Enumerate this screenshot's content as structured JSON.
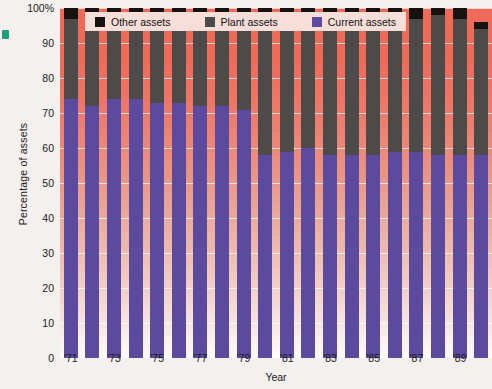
{
  "chart_data": {
    "type": "bar",
    "subtype": "100% stacked bar",
    "title": "",
    "xlabel": "Year",
    "ylabel": "Percentage of assets",
    "ylim": [
      0,
      100
    ],
    "yticks": [
      0,
      10,
      20,
      30,
      40,
      50,
      60,
      70,
      80,
      90,
      100
    ],
    "ytick_labels": [
      "0",
      "10",
      "20",
      "30",
      "40",
      "50",
      "60",
      "70",
      "80",
      "90",
      "100%"
    ],
    "grid": true,
    "legend_position": "top",
    "categories": [
      "'71",
      "'72",
      "'73",
      "'74",
      "'75",
      "'76",
      "'77",
      "'78",
      "'79",
      "'80",
      "'81",
      "'82",
      "'83",
      "'84",
      "'85",
      "'86",
      "'87",
      "'88",
      "'89",
      "'90"
    ],
    "xtick_labels": [
      "'71",
      "",
      "'73",
      "",
      "'75",
      "",
      "'77",
      "",
      "'79",
      "",
      "'81",
      "",
      "'83",
      "",
      "'85",
      "",
      "'87",
      "",
      "'89",
      ""
    ],
    "series": [
      {
        "name": "Current assets",
        "color": "#5b4a9e",
        "values": [
          74,
          72,
          74,
          74,
          73,
          73,
          72,
          72,
          71,
          58,
          59,
          60,
          58,
          58,
          58,
          59,
          59,
          58,
          58,
          58
        ]
      },
      {
        "name": "Plant assets",
        "color": "#4c4b49",
        "values": [
          23,
          25,
          23,
          23,
          24,
          24,
          26,
          25,
          26,
          40,
          39,
          38,
          40,
          40,
          40,
          38,
          38,
          40,
          39,
          36
        ]
      },
      {
        "name": "Other assets",
        "color": "#15120f",
        "values": [
          3,
          3,
          3,
          3,
          3,
          3,
          2,
          3,
          3,
          2,
          2,
          2,
          2,
          2,
          2,
          3,
          3,
          2,
          3,
          2
        ]
      }
    ]
  },
  "legend": {
    "items": [
      {
        "label": "Other assets",
        "color": "#15120f"
      },
      {
        "label": "Plant assets",
        "color": "#4c4b49"
      },
      {
        "label": "Current assets",
        "color": "#5b4a9e"
      }
    ]
  },
  "axes": {
    "y_title": "Percentage of assets",
    "x_title": "Year"
  },
  "colors": {
    "background_top": "#ef6a58",
    "background_bottom": "#fdfbfa",
    "legend_background": "#f7ded9",
    "gridline": "#ffffff",
    "margin_mark": "#1f9e7e"
  }
}
